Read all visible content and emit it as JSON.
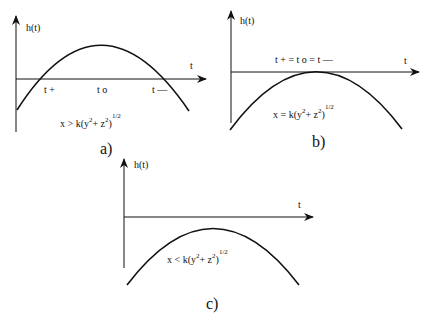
{
  "panels": [
    {
      "id": "a",
      "caption": "a)",
      "y_label": "h(t)",
      "x_label": "t",
      "roots": [
        "t +",
        "t o",
        "t —"
      ],
      "condition": {
        "lhs": "x >",
        "rhs": "k(y",
        "sq1": "2",
        "plus": "+ z",
        "sq2": "2",
        "close": ")",
        "pow": "1/2"
      }
    },
    {
      "id": "b",
      "caption": "b)",
      "y_label": "h(t)",
      "x_label": "t",
      "roots_equal": "t + = t o = t —",
      "condition": {
        "lhs": "x =",
        "rhs": "k(y",
        "sq1": "2",
        "plus": "+ z",
        "sq2": "2",
        "close": ")",
        "pow": "1/2"
      }
    },
    {
      "id": "c",
      "caption": "c)",
      "y_label": "h(t)",
      "x_label": "t",
      "condition": {
        "lhs": "x <",
        "rhs": "k(y",
        "sq1": "2",
        "plus": "+ z",
        "sq2": "2",
        "close": ")",
        "pow": "1/2"
      }
    }
  ]
}
